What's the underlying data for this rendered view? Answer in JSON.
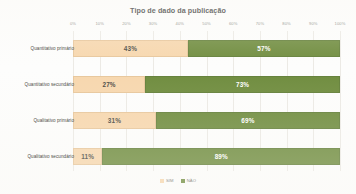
{
  "chart_data": {
    "type": "bar",
    "title": "Tipo de dado da publicação",
    "xlabel": "",
    "ylabel": "",
    "orientation": "horizontal",
    "stacked": true,
    "normalized_100": true,
    "xlim": [
      0,
      100
    ],
    "grid": true,
    "legend_position": "bottom",
    "categories": [
      "Quantitativo primário",
      "Quantitativo secundário",
      "Qualitativo primário",
      "Qualitativo secundário"
    ],
    "series": [
      {
        "name": "SIM",
        "color": "#f7d7ae",
        "values": [
          43,
          27,
          31,
          11
        ]
      },
      {
        "name": "NÃO",
        "color": "#6f8c3e",
        "values": [
          57,
          73,
          69,
          89
        ]
      }
    ],
    "value_labels": [
      [
        "43%",
        "57%"
      ],
      [
        "27%",
        "73%"
      ],
      [
        "31%",
        "69%"
      ],
      [
        "11%",
        "89%"
      ]
    ],
    "xticks": [
      0,
      10,
      20,
      30,
      40,
      50,
      60,
      70,
      80,
      90,
      100
    ],
    "xtick_labels": [
      "0%",
      "10%",
      "20%",
      "30%",
      "40%",
      "50%",
      "60%",
      "70%",
      "80%",
      "90%",
      "100%"
    ]
  },
  "colors": {
    "sim": "#f7d7ae",
    "nao": "#6f8c3e",
    "grid": "#eceae5",
    "title_text": "#3a3a38",
    "axis_text": "#8d8d88",
    "background": "#fdfdfc"
  }
}
